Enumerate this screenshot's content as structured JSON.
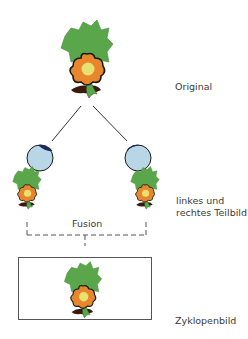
{
  "diagram": {
    "type": "binocular-fusion",
    "labels": {
      "original": "Original",
      "partial_images_line1": "linkes und",
      "partial_images_line2": "rechtes Teilbild",
      "fusion": "Fusion",
      "cyclopean": "Zyklopenbild"
    },
    "nodes": [
      {
        "id": "original-object",
        "label": "Original"
      },
      {
        "id": "left-eye"
      },
      {
        "id": "right-eye"
      },
      {
        "id": "left-partial-image",
        "label": "linkes Teilbild"
      },
      {
        "id": "right-partial-image",
        "label": "rechtes Teilbild"
      },
      {
        "id": "cyclopean-image",
        "label": "Zyklopenbild"
      }
    ],
    "edges": [
      {
        "from": "original-object",
        "to": "left-eye",
        "style": "solid"
      },
      {
        "from": "original-object",
        "to": "right-eye",
        "style": "solid"
      },
      {
        "from": "left-partial-image",
        "to": "cyclopean-image",
        "style": "dashed",
        "label": "Fusion"
      },
      {
        "from": "right-partial-image",
        "to": "cyclopean-image",
        "style": "dashed",
        "label": "Fusion"
      }
    ],
    "colors": {
      "leaf_green": "#5aa64a",
      "petal_orange": "#e8862c",
      "flower_center": "#e8e070",
      "outline": "#1a1a1a",
      "dark_soil": "#3a1a10",
      "eye_fill": "#b8d6e6",
      "eye_pupil": "#1e2a5a",
      "line": "#333333",
      "dash": "#555555",
      "box_border": "#555555"
    }
  }
}
